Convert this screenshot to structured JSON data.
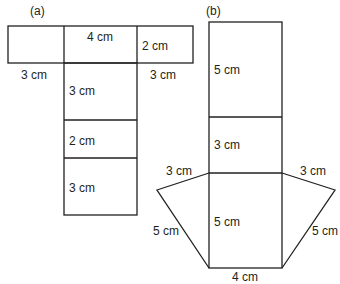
{
  "figure_a": {
    "label": "(a)",
    "dims": {
      "top_middle": "4 cm",
      "top_right": "2 cm",
      "left_below": "3 cm",
      "right_below": "3 cm",
      "seg1": "3 cm",
      "seg2": "2 cm",
      "seg3": "3 cm"
    }
  },
  "figure_b": {
    "label": "(b)",
    "dims": {
      "top_rect": "5 cm",
      "mid_rect": "3 cm",
      "left_top": "3 cm",
      "right_top": "3 cm",
      "center_rect": "5 cm",
      "left_slant": "5 cm",
      "right_slant": "5 cm",
      "bottom": "4 cm"
    }
  },
  "colors": {
    "line": "#231f20",
    "background": "#ffffff"
  }
}
